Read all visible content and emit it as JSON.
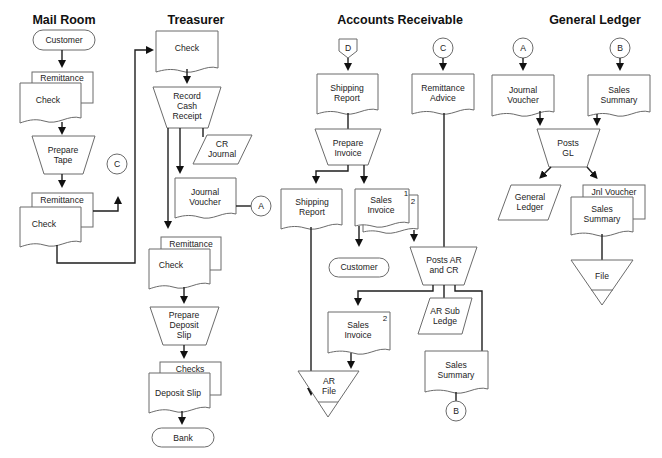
{
  "headers": {
    "mail_room": "Mail Room",
    "treasurer": "Treasurer",
    "accounts_receivable": "Accounts Receivable",
    "general_ledger": "General Ledger"
  },
  "mail_room": {
    "customer": "Customer",
    "doc1_back": "Remittance",
    "doc1_front": "Check",
    "process": [
      "Prepare",
      "Tape"
    ],
    "doc2_back": "Remittance",
    "doc2_front": "Check",
    "connector_c": "C"
  },
  "treasurer": {
    "check": "Check",
    "process1": [
      "Record",
      "Cash",
      "Receipt"
    ],
    "cr_journal": [
      "CR",
      "Journal"
    ],
    "journal_voucher": [
      "Journal",
      "Voucher"
    ],
    "connector_a": "A",
    "doc_back": "Remittance",
    "doc_front": "Check",
    "process2": [
      "Prepare",
      "Deposit",
      "Slip"
    ],
    "deposit_back": "Checks",
    "deposit_front": "Deposit Slip",
    "bank": "Bank"
  },
  "accounts_receivable": {
    "offpage_d": "D",
    "connector_c": "C",
    "shipping_report_top": [
      "Shipping",
      "Report"
    ],
    "remittance_advice": [
      "Remittance",
      "Advice"
    ],
    "prepare_invoice": [
      "Prepare",
      "Invoice"
    ],
    "shipping_report": [
      "Shipping",
      "Report"
    ],
    "sales_invoice": [
      "Sales",
      "Invoice"
    ],
    "copy1": "1",
    "copy2": "2",
    "customer": "Customer",
    "posts_ar_cr": [
      "Posts AR",
      "and CR"
    ],
    "sales_invoice2": [
      "Sales",
      "Invoice"
    ],
    "sales_invoice2_copy": "2",
    "ar_sub_ledger": [
      "AR Sub",
      "Ledge"
    ],
    "ar_file": [
      "AR",
      "File"
    ],
    "sales_summary": [
      "Sales",
      "Summary"
    ],
    "connector_b": "B"
  },
  "general_ledger": {
    "connector_a": "A",
    "connector_b": "B",
    "journal_voucher": [
      "Journal",
      "Voucher"
    ],
    "sales_summary": [
      "Sales",
      "Summary"
    ],
    "posts_gl": [
      "Posts",
      "GL"
    ],
    "general_ledger": [
      "General",
      "Ledger"
    ],
    "doc_back": "Jnl Voucher",
    "doc_front": [
      "Sales",
      "Summary"
    ],
    "file": "File"
  },
  "colors": {
    "shape_stroke": "#6b6b6b",
    "flow_line": "#1e1e1e",
    "background": "#ffffff"
  }
}
